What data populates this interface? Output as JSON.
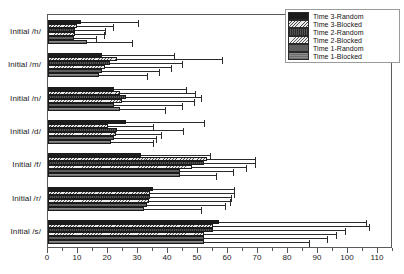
{
  "chart_data": {
    "type": "bar",
    "orientation": "horizontal",
    "title": "",
    "xlabel": "",
    "ylabel": "",
    "xlim": [
      0,
      115
    ],
    "ylim": [
      0,
      7
    ],
    "grid": false,
    "legend_position": "top-right",
    "xticks": [
      0,
      10,
      20,
      30,
      40,
      50,
      60,
      70,
      80,
      90,
      100,
      110
    ],
    "xtick_labels": [
      "0",
      "10",
      "20",
      "30",
      "40",
      "50",
      "60",
      "70",
      "80",
      "90",
      "100",
      "110"
    ],
    "minor_tick_step": 5,
    "categories": [
      "Initial /h/",
      "Initial /m/",
      "Initial /n/",
      "Initial /d/",
      "Initial /f/",
      "Initial /r/",
      "Initial /s/"
    ],
    "series": [
      {
        "name": "Time 3-Random",
        "swatch": "solid-black",
        "values": [
          11.0,
          18.0,
          22.0,
          26.0,
          31.0,
          35.0,
          57.0
        ],
        "errors": [
          19.0,
          24.0,
          24.0,
          26.0,
          23.0,
          27.0,
          49.0
        ]
      },
      {
        "name": "Time 3-Blocked",
        "swatch": "hatch-light",
        "values": [
          9.5,
          23.0,
          24.0,
          20.0,
          53.0,
          34.0,
          55.0
        ],
        "errors": [
          12.0,
          35.0,
          25.0,
          15.0,
          16.0,
          28.0,
          52.0
        ]
      },
      {
        "name": "Time 2-Random",
        "swatch": "dark-vertical-hatch",
        "values": [
          9.0,
          20.5,
          26.0,
          23.0,
          52.0,
          34.0,
          55.0
        ],
        "errors": [
          10.0,
          24.0,
          25.0,
          22.0,
          17.0,
          27.0,
          44.0
        ]
      },
      {
        "name": "Time 2-Blocked",
        "swatch": "hatch-light-2",
        "values": [
          9.0,
          19.0,
          24.5,
          22.5,
          48.0,
          33.5,
          52.0
        ],
        "errors": [
          9.5,
          22.0,
          24.0,
          15.0,
          18.0,
          27.0,
          44.0
        ]
      },
      {
        "name": "Time 1-Random",
        "swatch": "gray-solid",
        "values": [
          8.5,
          18.0,
          22.0,
          22.0,
          44.0,
          33.0,
          52.0
        ],
        "errors": [
          7.5,
          19.0,
          22.5,
          14.0,
          17.5,
          26.0,
          41.0
        ]
      },
      {
        "name": "Time 1-Blocked",
        "swatch": "gray-hatch",
        "values": [
          13.0,
          17.0,
          24.0,
          21.0,
          44.0,
          32.0,
          52.0
        ],
        "errors": [
          15.0,
          16.0,
          15.0,
          14.0,
          12.0,
          19.0,
          35.0
        ]
      }
    ]
  },
  "legend": {
    "items": [
      {
        "label": "Time 3-Random"
      },
      {
        "label": "Time 3-Blocked"
      },
      {
        "label": "Time 2-Random"
      },
      {
        "label": "Time 2-Blocked"
      },
      {
        "label": "Time 1-Random"
      },
      {
        "label": "Time 1-Blocked"
      }
    ]
  }
}
